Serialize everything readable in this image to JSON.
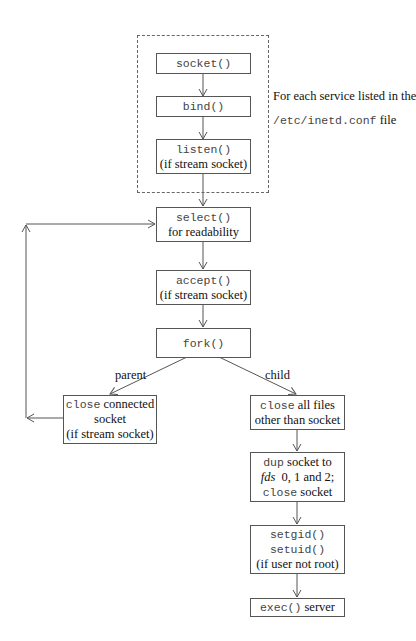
{
  "diagram": {
    "loop_annotation": {
      "line1": "For each service listed in the",
      "line2_code": "/etc/inetd.conf",
      "line2_text": "file"
    },
    "nodes": {
      "socket": {
        "code": "socket()"
      },
      "bind": {
        "code": "bind()"
      },
      "listen": {
        "code": "listen()",
        "text": "(if stream socket)"
      },
      "select": {
        "code": "select()",
        "text": "for readability"
      },
      "accept": {
        "code": "accept()",
        "text": "(if stream socket)"
      },
      "fork": {
        "code": "fork()"
      },
      "parent_close": {
        "code": "close",
        "text1": "connected",
        "text2": "socket",
        "text3": "(if stream socket)"
      },
      "child_close": {
        "code": "close",
        "text1": "all files",
        "text2": "other than socket"
      },
      "dup": {
        "code1": "dup",
        "text1": "socket to",
        "ital": "fds",
        "text2": "0, 1 and 2;",
        "code2": "close",
        "text3": "socket"
      },
      "setid": {
        "code1": "setgid()",
        "code2": "setuid()",
        "text": "(if user not root)"
      },
      "exec": {
        "code": "exec()",
        "text": "server"
      }
    },
    "edge_labels": {
      "parent": "parent",
      "child": "child"
    }
  }
}
